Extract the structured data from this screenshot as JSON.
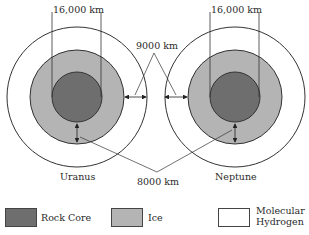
{
  "diagram": {
    "type": "planet-interior-comparison",
    "planets": [
      {
        "name": "Uranus",
        "core_width_label": "16,000 km"
      },
      {
        "name": "Neptune",
        "core_width_label": "16,000 km"
      }
    ],
    "annotations": {
      "hydrogen_layer_thickness": "9000 km",
      "ice_layer_thickness": "8000 km"
    },
    "legend": [
      {
        "label": "Rock Core",
        "color": "#6e6e6e"
      },
      {
        "label": "Ice",
        "color": "#b4b4b4"
      },
      {
        "label_line1": "Molecular",
        "label_line2": "Hydrogen",
        "color": "#ffffff"
      }
    ]
  }
}
